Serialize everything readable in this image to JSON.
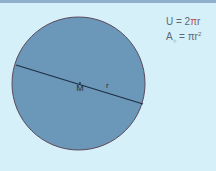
{
  "diagram": {
    "circle": {
      "fill": "#6a97b8",
      "stroke": "#5a3a4a"
    },
    "center_label": "M",
    "radius_label": "r",
    "formulas": {
      "circumference_lhs": "U = 2",
      "circumference_pi": "π",
      "circumference_rhs": "r",
      "area_lhs": "A",
      "area_sub": "○",
      "area_rhs": " = πr",
      "area_sup": "2"
    }
  }
}
